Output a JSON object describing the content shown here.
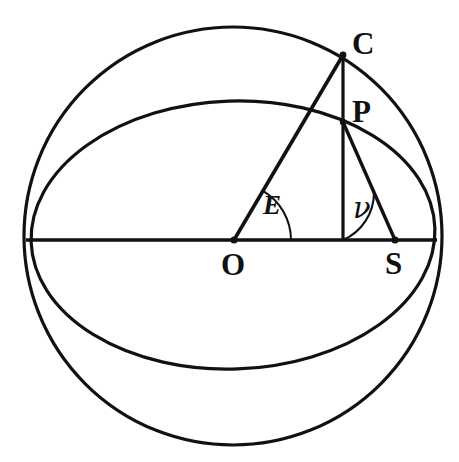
{
  "figure": {
    "background_color": "#ffffff",
    "stroke_color": "#111111",
    "canvas": {
      "width": 459,
      "height": 462
    }
  },
  "labels": {
    "center": "O",
    "circle_point": "C",
    "orbit_point": "P",
    "focus": "S",
    "angle_eccentric": "E",
    "angle_true": "ν"
  },
  "geometry": {
    "outer_circle": {
      "cx": 233,
      "cy": 236,
      "r": 209,
      "name": "auxiliary-circle"
    },
    "ellipse": {
      "cx": 233,
      "cy": 235,
      "rx": 202,
      "ry": 134,
      "rotation": -2,
      "name": "orbit-ellipse"
    },
    "points": {
      "O": {
        "x": 234,
        "y": 240
      },
      "C": {
        "x": 343,
        "y": 55
      },
      "P": {
        "x": 343,
        "y": 122
      },
      "S": {
        "x": 395,
        "y": 240
      },
      "foot": {
        "x": 343,
        "y": 240
      }
    },
    "axis": {
      "x1": 26,
      "y1": 240,
      "x2": 437,
      "y2": 240,
      "name": "major-axis"
    },
    "angles": {
      "E_arc_radius": 57,
      "nu_arc_radius": 52
    }
  },
  "label_positions": {
    "C": {
      "left": 352,
      "top": 28
    },
    "P": {
      "left": 352,
      "top": 96
    },
    "O": {
      "left": 221,
      "top": 249
    },
    "S": {
      "left": 385,
      "top": 248
    },
    "E": {
      "left": 263,
      "top": 192
    },
    "nu": {
      "left": 353,
      "top": 194
    }
  }
}
